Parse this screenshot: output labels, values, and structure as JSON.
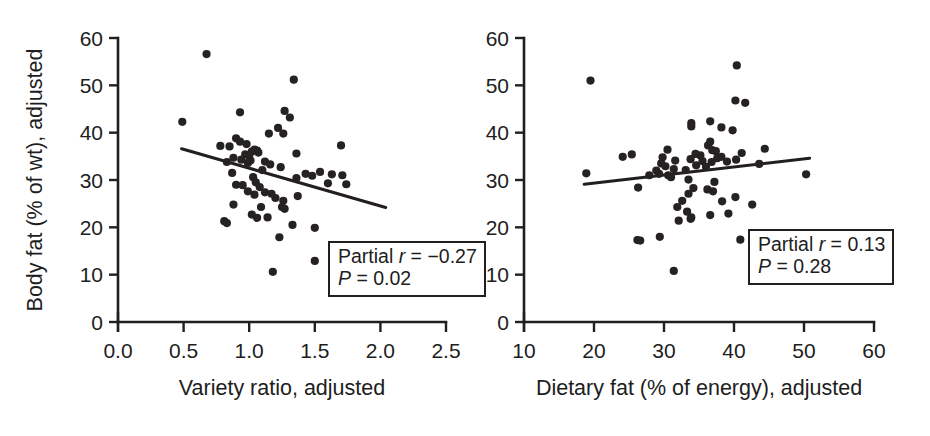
{
  "figure": {
    "background": "#ffffff",
    "ink_color": "#231f1f"
  },
  "chart_data": [
    {
      "id": "left",
      "type": "scatter",
      "title": "",
      "xlabel": "Variety ratio, adjusted",
      "ylabel": "Body fat (% of wt), adjusted",
      "xlim": [
        0.0,
        2.5
      ],
      "ylim": [
        0,
        60
      ],
      "xticks": [
        0.0,
        0.5,
        1.0,
        1.5,
        2.0,
        2.5
      ],
      "xticklabels": [
        "0.0",
        "0.5",
        "1.0",
        "1.5",
        "2.0",
        "2.5"
      ],
      "yticks": [
        0,
        10,
        20,
        30,
        40,
        50,
        60
      ],
      "yticklabels": [
        "0",
        "10",
        "20",
        "30",
        "40",
        "50",
        "60"
      ],
      "grid": false,
      "legend": "none",
      "annotation": {
        "line1_prefix": "Partial ",
        "line1_symbol": "r",
        "line1_value": " = −0.27",
        "line2_symbol": "P",
        "line2_value": " = 0.02"
      },
      "fit_line": {
        "x": [
          0.485,
          2.04
        ],
        "y": [
          36.6,
          24.2
        ]
      },
      "points": [
        [
          0.675,
          56.6
        ],
        [
          1.34,
          51.2
        ],
        [
          0.49,
          42.3
        ],
        [
          0.93,
          44.3
        ],
        [
          1.27,
          44.6
        ],
        [
          1.31,
          43.2
        ],
        [
          1.22,
          41.0
        ],
        [
          1.26,
          39.8
        ],
        [
          1.15,
          39.8
        ],
        [
          0.9,
          38.8
        ],
        [
          0.93,
          38.1
        ],
        [
          0.98,
          37.6
        ],
        [
          1.7,
          37.3
        ],
        [
          0.78,
          37.2
        ],
        [
          0.85,
          37.1
        ],
        [
          1.04,
          36.4
        ],
        [
          1.06,
          36.2
        ],
        [
          1.02,
          36.0
        ],
        [
          1.07,
          35.8
        ],
        [
          1.36,
          35.6
        ],
        [
          0.97,
          35.4
        ],
        [
          1.0,
          35.1
        ],
        [
          0.88,
          34.7
        ],
        [
          0.94,
          34.3
        ],
        [
          1.01,
          34.1
        ],
        [
          0.83,
          33.8
        ],
        [
          0.99,
          33.6
        ],
        [
          1.12,
          33.9
        ],
        [
          1.16,
          33.3
        ],
        [
          1.24,
          32.7
        ],
        [
          1.1,
          32.1
        ],
        [
          1.54,
          31.7
        ],
        [
          1.43,
          31.3
        ],
        [
          1.48,
          30.9
        ],
        [
          1.63,
          31.2
        ],
        [
          1.71,
          31.0
        ],
        [
          0.87,
          31.5
        ],
        [
          1.03,
          30.6
        ],
        [
          1.36,
          30.4
        ],
        [
          1.6,
          29.3
        ],
        [
          1.74,
          29.1
        ],
        [
          0.9,
          29.0
        ],
        [
          0.95,
          28.9
        ],
        [
          1.05,
          29.5
        ],
        [
          1.08,
          28.5
        ],
        [
          0.99,
          27.6
        ],
        [
          1.12,
          27.4
        ],
        [
          1.17,
          27.1
        ],
        [
          1.04,
          26.9
        ],
        [
          1.2,
          26.2
        ],
        [
          1.37,
          26.6
        ],
        [
          1.26,
          25.6
        ],
        [
          0.88,
          24.8
        ],
        [
          1.09,
          24.3
        ],
        [
          1.25,
          24.3
        ],
        [
          1.27,
          23.9
        ],
        [
          1.02,
          22.7
        ],
        [
          1.06,
          22.0
        ],
        [
          1.14,
          22.1
        ],
        [
          0.81,
          21.3
        ],
        [
          0.83,
          20.9
        ],
        [
          1.33,
          20.5
        ],
        [
          1.5,
          19.9
        ],
        [
          1.23,
          17.9
        ],
        [
          1.5,
          12.9
        ],
        [
          1.18,
          10.6
        ]
      ]
    },
    {
      "id": "right",
      "type": "scatter",
      "title": "",
      "xlabel": "Dietary fat (% of energy), adjusted",
      "ylabel": "Body fat (% of wt), adjusted",
      "xlim": [
        10,
        60
      ],
      "ylim": [
        0,
        60
      ],
      "xticks": [
        10,
        20,
        30,
        40,
        50,
        60
      ],
      "xticklabels": [
        "10",
        "20",
        "30",
        "40",
        "50",
        "60"
      ],
      "yticks": [
        0,
        10,
        20,
        30,
        40,
        50,
        60
      ],
      "yticklabels": [
        "0",
        "10",
        "20",
        "30",
        "40",
        "50",
        "60"
      ],
      "grid": false,
      "legend": "none",
      "annotation": {
        "line1_prefix": "Partial ",
        "line1_symbol": "r",
        "line1_value": " = 0.13",
        "line2_symbol": "P",
        "line2_value": " = 0.28"
      },
      "fit_line": {
        "x": [
          18.6,
          50.8
        ],
        "y": [
          29.1,
          34.6
        ]
      },
      "points": [
        [
          40.4,
          54.2
        ],
        [
          19.5,
          51.0
        ],
        [
          40.2,
          46.8
        ],
        [
          41.6,
          46.3
        ],
        [
          36.6,
          42.4
        ],
        [
          33.9,
          42.0
        ],
        [
          33.9,
          41.3
        ],
        [
          38.2,
          41.1
        ],
        [
          39.8,
          40.5
        ],
        [
          36.6,
          38.1
        ],
        [
          36.3,
          37.3
        ],
        [
          44.4,
          36.6
        ],
        [
          30.5,
          36.4
        ],
        [
          36.9,
          36.3
        ],
        [
          37.4,
          36.1
        ],
        [
          41.1,
          35.7
        ],
        [
          25.4,
          35.4
        ],
        [
          24.1,
          34.9
        ],
        [
          29.8,
          34.8
        ],
        [
          34.5,
          35.5
        ],
        [
          35.2,
          35.2
        ],
        [
          38.2,
          34.9
        ],
        [
          40.3,
          34.3
        ],
        [
          31.6,
          34.1
        ],
        [
          33.8,
          34.4
        ],
        [
          35.5,
          34.0
        ],
        [
          36.8,
          33.8
        ],
        [
          37.6,
          34.6
        ],
        [
          39.0,
          33.9
        ],
        [
          29.6,
          33.5
        ],
        [
          30.2,
          32.9
        ],
        [
          34.6,
          33.1
        ],
        [
          36.0,
          32.8
        ],
        [
          43.6,
          33.4
        ],
        [
          28.9,
          32.0
        ],
        [
          31.4,
          32.3
        ],
        [
          33.1,
          32.1
        ],
        [
          29.3,
          31.3
        ],
        [
          27.9,
          31.0
        ],
        [
          30.6,
          31.0
        ],
        [
          18.9,
          31.4
        ],
        [
          50.3,
          31.2
        ],
        [
          31.0,
          30.6
        ],
        [
          33.5,
          30.1
        ],
        [
          37.2,
          29.6
        ],
        [
          26.3,
          28.4
        ],
        [
          34.2,
          28.3
        ],
        [
          36.2,
          28.0
        ],
        [
          37.0,
          27.6
        ],
        [
          33.5,
          27.1
        ],
        [
          40.2,
          26.4
        ],
        [
          32.6,
          25.6
        ],
        [
          38.3,
          25.5
        ],
        [
          42.6,
          24.8
        ],
        [
          31.9,
          24.3
        ],
        [
          33.3,
          23.3
        ],
        [
          39.2,
          22.9
        ],
        [
          36.6,
          22.6
        ],
        [
          33.9,
          22.1
        ],
        [
          32.1,
          21.4
        ],
        [
          33.8,
          21.8
        ],
        [
          29.4,
          18.0
        ],
        [
          40.9,
          17.4
        ],
        [
          26.2,
          17.3
        ],
        [
          26.6,
          17.2
        ],
        [
          31.4,
          10.8
        ]
      ]
    }
  ]
}
